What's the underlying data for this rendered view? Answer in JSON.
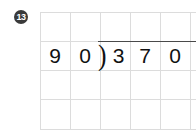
{
  "problem": {
    "number": "13",
    "badge_color": "#3a3a3a",
    "badge_text_color": "#ffffff"
  },
  "worksheet": {
    "type": "long-division",
    "grid": {
      "columns": 6,
      "rows": 4,
      "line_color": "#dcdcdc",
      "cell_width_px": 30,
      "cell_height_px": 29
    },
    "division": {
      "divisor": "90",
      "dividend": "370",
      "quotient": "",
      "bracket_glyph": ")",
      "vinculum_color": "#4a4a4a"
    },
    "rows": [
      {
        "name": "quotient-row",
        "cells": [
          "",
          "",
          "",
          "",
          "",
          ""
        ]
      },
      {
        "name": "dividend-row",
        "cells": [
          "9",
          "0",
          "3",
          "7",
          "0",
          ""
        ]
      },
      {
        "name": "work-row-1",
        "cells": [
          "",
          "",
          "",
          "",
          "",
          ""
        ]
      },
      {
        "name": "work-row-2",
        "cells": [
          "",
          "",
          "",
          "",
          "",
          ""
        ]
      }
    ]
  }
}
